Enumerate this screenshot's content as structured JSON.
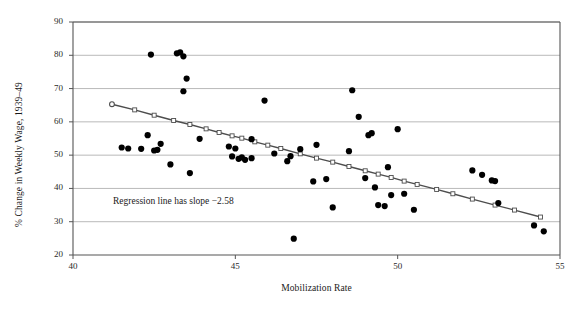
{
  "chart_data": {
    "type": "scatter",
    "title": "",
    "xlabel": "Mobilization Rate",
    "ylabel": "% Change in Weekly Wage, 1939–49",
    "xlim": [
      40,
      55
    ],
    "ylim": [
      20,
      90
    ],
    "xticks": [
      40,
      45,
      50,
      55
    ],
    "yticks": [
      20,
      30,
      40,
      50,
      60,
      70,
      80,
      90
    ],
    "grid": "horizontal",
    "legend": "none",
    "annotations": [
      {
        "text": "Regression line has slope −2.58",
        "x": 41.4,
        "y": 37.6
      }
    ],
    "series": [
      {
        "name": "States",
        "marker": "filled-circle",
        "color": "#000000",
        "points": [
          [
            41.5,
            52.3
          ],
          [
            41.7,
            52.0
          ],
          [
            42.1,
            51.9
          ],
          [
            42.3,
            56.0
          ],
          [
            42.4,
            80.2
          ],
          [
            42.5,
            51.4
          ],
          [
            42.6,
            51.6
          ],
          [
            42.7,
            53.4
          ],
          [
            43.0,
            47.2
          ],
          [
            43.2,
            80.6
          ],
          [
            43.3,
            80.9
          ],
          [
            43.4,
            79.7
          ],
          [
            43.4,
            69.2
          ],
          [
            43.5,
            73.0
          ],
          [
            43.6,
            44.6
          ],
          [
            43.9,
            54.9
          ],
          [
            44.8,
            52.6
          ],
          [
            44.9,
            49.6
          ],
          [
            45.0,
            52.0
          ],
          [
            45.1,
            48.9
          ],
          [
            45.2,
            49.3
          ],
          [
            45.3,
            48.6
          ],
          [
            45.5,
            49.1
          ],
          [
            45.5,
            54.8
          ],
          [
            45.9,
            66.4
          ],
          [
            46.2,
            50.5
          ],
          [
            46.6,
            48.2
          ],
          [
            46.7,
            49.7
          ],
          [
            46.8,
            24.9
          ],
          [
            47.0,
            51.8
          ],
          [
            47.4,
            42.1
          ],
          [
            47.5,
            53.1
          ],
          [
            47.8,
            42.8
          ],
          [
            48.0,
            34.3
          ],
          [
            48.5,
            51.2
          ],
          [
            48.6,
            69.5
          ],
          [
            48.8,
            61.5
          ],
          [
            49.0,
            43.1
          ],
          [
            49.1,
            56.0
          ],
          [
            49.2,
            56.6
          ],
          [
            49.3,
            40.3
          ],
          [
            49.4,
            35.0
          ],
          [
            49.6,
            34.7
          ],
          [
            49.7,
            46.4
          ],
          [
            49.8,
            38.0
          ],
          [
            50.0,
            57.8
          ],
          [
            50.2,
            38.4
          ],
          [
            50.5,
            33.6
          ],
          [
            52.3,
            45.4
          ],
          [
            52.6,
            44.1
          ],
          [
            52.9,
            42.4
          ],
          [
            53.0,
            42.2
          ],
          [
            53.1,
            35.6
          ],
          [
            54.2,
            28.9
          ],
          [
            54.5,
            27.1
          ]
        ]
      },
      {
        "name": "Regression line",
        "marker": "open-square",
        "color": "#4d4d4d",
        "points": [
          [
            41.2,
            65.3
          ],
          [
            41.9,
            63.6
          ],
          [
            42.5,
            62.0
          ],
          [
            43.1,
            60.4
          ],
          [
            43.6,
            59.2
          ],
          [
            44.1,
            57.9
          ],
          [
            44.5,
            56.8
          ],
          [
            44.9,
            55.8
          ],
          [
            45.2,
            55.1
          ],
          [
            45.6,
            54.0
          ],
          [
            46.0,
            53.0
          ],
          [
            46.4,
            52.0
          ],
          [
            47.0,
            50.4
          ],
          [
            47.5,
            49.1
          ],
          [
            48.0,
            47.9
          ],
          [
            48.5,
            46.6
          ],
          [
            49.0,
            45.3
          ],
          [
            49.4,
            44.3
          ],
          [
            49.8,
            43.3
          ],
          [
            50.2,
            42.2
          ],
          [
            50.6,
            41.2
          ],
          [
            51.2,
            39.7
          ],
          [
            51.7,
            38.4
          ],
          [
            52.3,
            36.8
          ],
          [
            53.0,
            35.0
          ],
          [
            53.6,
            33.5
          ],
          [
            54.4,
            31.4
          ]
        ]
      }
    ]
  }
}
